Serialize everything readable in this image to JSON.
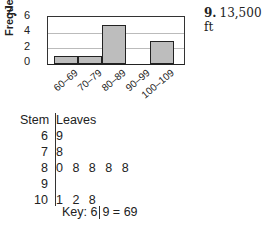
{
  "problem7": {
    "number": "7.",
    "histogram": {
      "ylabel": "Frequency",
      "yticks": [
        "6",
        "4",
        "2",
        "0"
      ]
    },
    "stem_leaf": {
      "header_stem": "Stem",
      "header_leaves": "Leaves",
      "rows": [
        {
          "stem": "6",
          "leaves": "9"
        },
        {
          "stem": "7",
          "leaves": "8"
        },
        {
          "stem": "8",
          "leaves": "0 8 8 8 8"
        },
        {
          "stem": "9",
          "leaves": ""
        },
        {
          "stem": "10",
          "leaves": "1 2 8"
        }
      ],
      "key_prefix": "Key: 6",
      "key_suffix": "9 = 69"
    }
  },
  "problem9": {
    "number": "9.",
    "answer": "13,500 ft"
  },
  "chart_data": [
    {
      "type": "bar",
      "title": "",
      "xlabel": "",
      "ylabel": "Frequency",
      "categories": [
        "60–69",
        "70–79",
        "80–89",
        "90–99",
        "100–109"
      ],
      "values": [
        1,
        1,
        5,
        0,
        3
      ],
      "ylim": [
        0,
        6
      ],
      "yticks": [
        0,
        2,
        4,
        6
      ],
      "grid": true,
      "histogram": true
    },
    {
      "type": "table",
      "title": "Stem-and-leaf plot",
      "columns": [
        "Stem",
        "Leaves"
      ],
      "rows": [
        [
          "6",
          "9"
        ],
        [
          "7",
          "8"
        ],
        [
          "8",
          "0 8 8 8 8"
        ],
        [
          "9",
          ""
        ],
        [
          "10",
          "1 2 8"
        ]
      ],
      "key": "6 | 9 = 69"
    }
  ]
}
